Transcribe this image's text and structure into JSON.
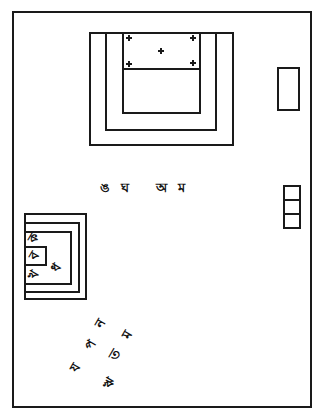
{
  "diagram": {
    "type": "floor-plan line drawing",
    "stroke_color": "#1a1a1a",
    "background": "#ffffff",
    "top_block": {
      "cross_marks": [
        "+",
        "+",
        "+",
        "+",
        "+"
      ]
    },
    "middle_labels": [
      {
        "text": "ঙ",
        "x": 101,
        "y": 181
      },
      {
        "text": "ঘ",
        "x": 122,
        "y": 181
      },
      {
        "text": "অ",
        "x": 157,
        "y": 181
      },
      {
        "text": "ম",
        "x": 179,
        "y": 181
      }
    ],
    "left_block_labels": [
      {
        "text": "ক",
        "x": 29,
        "y": 232,
        "rot": -60
      },
      {
        "text": "ব",
        "x": 30,
        "y": 249,
        "rot": -60
      },
      {
        "text": "খ",
        "x": 30,
        "y": 268,
        "rot": -60
      },
      {
        "text": "ধ",
        "x": 52,
        "y": 261,
        "rot": -60
      }
    ],
    "bottom_labels": [
      {
        "text": "ন",
        "x": 96,
        "y": 318,
        "rot": -60
      },
      {
        "text": "ম",
        "x": 124,
        "y": 329,
        "rot": -60
      },
      {
        "text": "প",
        "x": 87,
        "y": 339,
        "rot": -60
      },
      {
        "text": "ত",
        "x": 110,
        "y": 349,
        "rot": -60
      },
      {
        "text": "য",
        "x": 71,
        "y": 362,
        "rot": -60
      },
      {
        "text": "ঋ",
        "x": 103,
        "y": 377,
        "rot": -60
      }
    ]
  }
}
